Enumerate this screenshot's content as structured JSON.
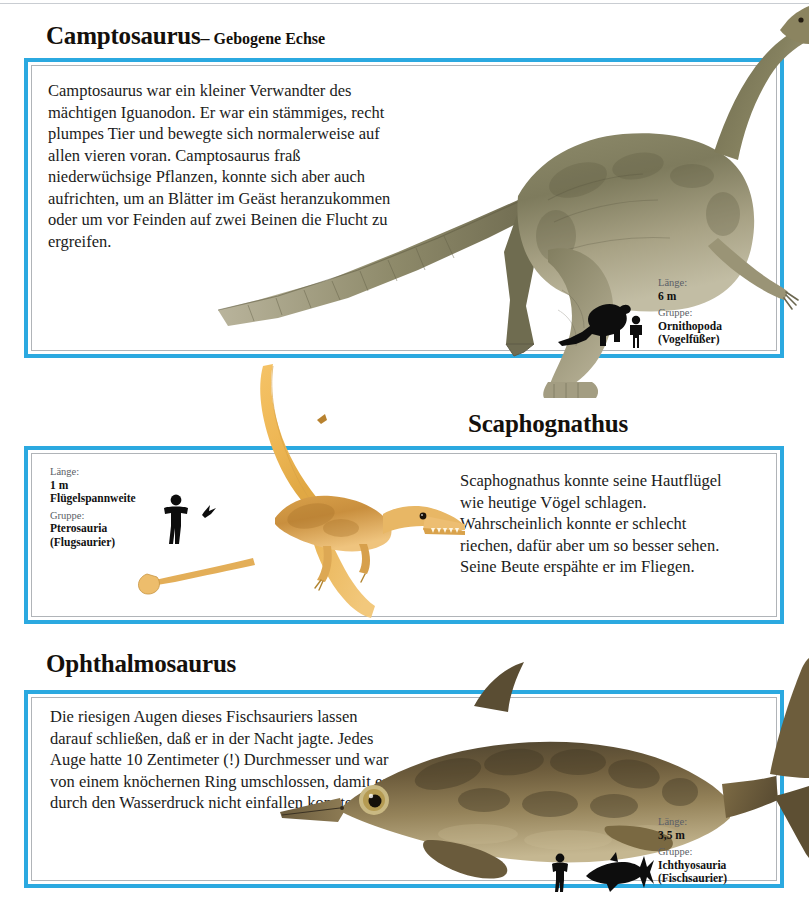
{
  "page": {
    "background": "#ffffff",
    "accent_blue": "#2ba9e0",
    "text_color": "#1b1b20"
  },
  "sections": [
    {
      "id": "camptosaurus",
      "heading": {
        "scientific_name": "Camptosaurus",
        "dash": "–",
        "common_name": "Gebogene Echse"
      },
      "body": "Camptosaurus war ein kleiner Verwandter des mächtigen Iguanodon. Er war ein stämmiges, recht plumpes Tier und bewegte sich normalerweise auf allen vieren voran. Camptosaurus fraß niederwüchsige Pflanzen, konnte sich aber auch aufrichten, um an Blätter im Geäst heranzukommen oder um vor Feinden auf zwei Beinen die Flucht zu ergreifen.",
      "info": {
        "length_label": "Länge:",
        "length_value": "6 m",
        "group_label": "Gruppe:",
        "group_value": "Ornithopoda",
        "group_common": "(Vogelfüßer)"
      },
      "scale_icons": [
        "camptosaurus-silhouette",
        "human-silhouette"
      ],
      "artwork": "camptosaurus-illustration"
    },
    {
      "id": "scaphognathus",
      "heading": {
        "scientific_name": "Scaphognathus",
        "dash": "",
        "common_name": ""
      },
      "body": "Scaphognathus konnte seine Hautflügel wie heutige Vögel schlagen. Wahrscheinlich konnte er schlecht riechen, dafür aber um so besser sehen. Seine Beute erspähte er im Fliegen.",
      "info": {
        "length_label": "Länge:",
        "length_value": "1 m",
        "length_value_2": "Flügelspannweite",
        "group_label": "Gruppe:",
        "group_value": "Pterosauria",
        "group_common": "(Flugsaurier)"
      },
      "scale_icons": [
        "human-silhouette",
        "scaphognathus-silhouette"
      ],
      "artwork": "scaphognathus-illustration"
    },
    {
      "id": "ophthalmosaurus",
      "heading": {
        "scientific_name": "Ophthalmosaurus",
        "dash": "",
        "common_name": ""
      },
      "body": "Die riesigen Augen dieses Fischsauriers lassen darauf schließen, daß er in der Nacht jagte. Jedes Auge hatte 10 Zentimeter (!) Durchmesser und war von einem knöchernen Ring umschlossen, damit es durch den Wasserdruck nicht einfallen konnte.",
      "info": {
        "length_label": "Länge:",
        "length_value": "3,5 m",
        "group_label": "Gruppe:",
        "group_value": "Ichthyosauria",
        "group_common": "(Fischsaurier)"
      },
      "scale_icons": [
        "human-silhouette",
        "ichthyosaur-silhouette"
      ],
      "artwork": "ophthalmosaurus-illustration"
    }
  ]
}
